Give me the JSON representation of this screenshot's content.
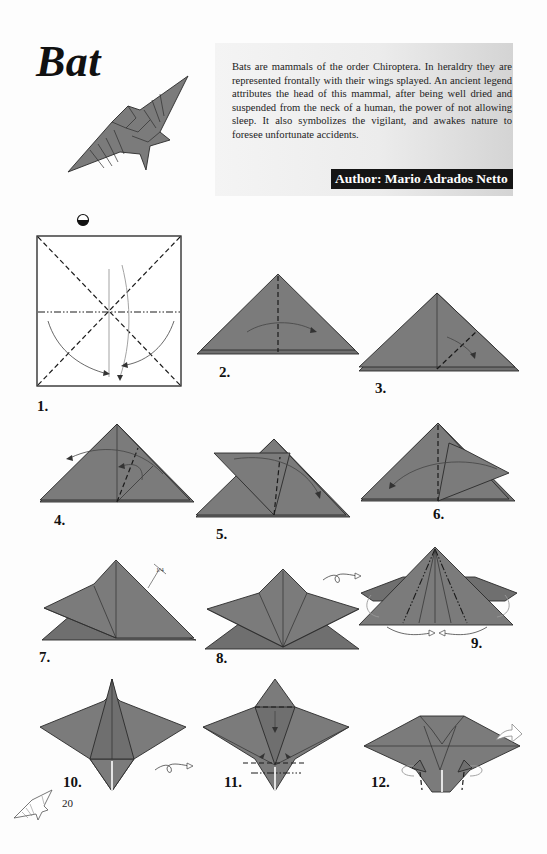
{
  "header": {
    "title": "Bat",
    "description": "Bats are mammals of the order Chiroptera. In heraldry they are represented frontally with their wings splayed. An ancient legend attributes the head of this mammal, after being well dried and suspended from the neck of a human, the power of not allowing sleep. It also symbolizes the vigilant, and awakes nature to foresee unfortunate accidents.",
    "author": "Author: Mario Adrados Netto"
  },
  "steps": [
    {
      "number": "1.",
      "annotation": "turn-over-symbol"
    },
    {
      "number": "2."
    },
    {
      "number": "3."
    },
    {
      "number": "4."
    },
    {
      "number": "5."
    },
    {
      "number": "6."
    },
    {
      "number": "7.",
      "annotation": "1/4"
    },
    {
      "number": "8.",
      "annotation": "turn-over-arrow"
    },
    {
      "number": "9."
    },
    {
      "number": "10.",
      "annotation": "turn-over-arrow"
    },
    {
      "number": "11."
    },
    {
      "number": "12."
    }
  ],
  "footer": {
    "page_number": "20"
  },
  "colors": {
    "paper": "#7b7b7b",
    "author_badge": "#151515",
    "header_box": "#ececec"
  }
}
